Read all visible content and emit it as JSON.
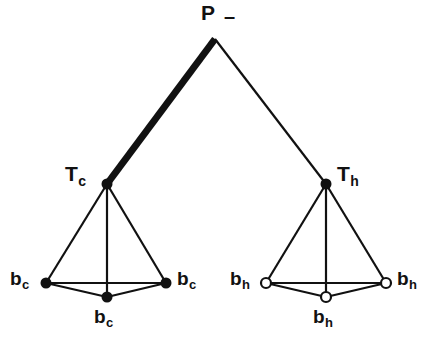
{
  "figure": {
    "background_color": "#ffffff",
    "ink_color": "#111111",
    "width": 431,
    "height": 347
  },
  "nodes": {
    "root": {
      "id": "P",
      "label_main": "P",
      "label_sub": "",
      "marker": "none",
      "x": 215,
      "y": 39,
      "annotation": "–",
      "annotation_name": "dash-mark"
    },
    "tc": {
      "id": "Tc",
      "label_main": "T",
      "label_sub": "c",
      "marker": "filled",
      "x": 107,
      "y": 184
    },
    "th": {
      "id": "Th",
      "label_main": "T",
      "label_sub": "h",
      "marker": "filled",
      "x": 326,
      "y": 184
    },
    "bc_left": {
      "id": "bc-left",
      "label_main": "b",
      "label_sub": "c",
      "marker": "filled",
      "x": 46,
      "y": 283
    },
    "bc_right": {
      "id": "bc-right",
      "label_main": "b",
      "label_sub": "c",
      "marker": "filled",
      "x": 166,
      "y": 283
    },
    "bc_center": {
      "id": "bc-center",
      "label_main": "b",
      "label_sub": "c",
      "marker": "filled",
      "x": 107,
      "y": 297
    },
    "bh_left": {
      "id": "bh-left",
      "label_main": "b",
      "label_sub": "h",
      "marker": "open",
      "x": 266,
      "y": 283
    },
    "bh_right": {
      "id": "bh-right",
      "label_main": "b",
      "label_sub": "h",
      "marker": "open",
      "x": 386,
      "y": 283
    },
    "bh_center": {
      "id": "bh-center",
      "label_main": "b",
      "label_sub": "h",
      "marker": "open",
      "x": 326,
      "y": 297
    }
  },
  "edges": [
    {
      "name": "edge-p-tc",
      "from": "root",
      "to": "tc",
      "weight": "thick"
    },
    {
      "name": "edge-p-th",
      "from": "root",
      "to": "th",
      "weight": "thin"
    },
    {
      "name": "edge-tc-bc-left",
      "from": "tc",
      "to": "bc_left",
      "weight": "thin"
    },
    {
      "name": "edge-tc-bc-center",
      "from": "tc",
      "to": "bc_center",
      "weight": "thin"
    },
    {
      "name": "edge-tc-bc-right",
      "from": "tc",
      "to": "bc_right",
      "weight": "thin"
    },
    {
      "name": "edge-bc-left-right",
      "from": "bc_left",
      "to": "bc_right",
      "weight": "thin"
    },
    {
      "name": "edge-bc-left-center",
      "from": "bc_left",
      "to": "bc_center",
      "weight": "thin"
    },
    {
      "name": "edge-bc-center-right",
      "from": "bc_center",
      "to": "bc_right",
      "weight": "thin"
    },
    {
      "name": "edge-th-bh-left",
      "from": "th",
      "to": "bh_left",
      "weight": "thin"
    },
    {
      "name": "edge-th-bh-center",
      "from": "th",
      "to": "bh_center",
      "weight": "thin"
    },
    {
      "name": "edge-th-bh-right",
      "from": "th",
      "to": "bh_right",
      "weight": "thin"
    },
    {
      "name": "edge-bh-left-right",
      "from": "bh_left",
      "to": "bh_right",
      "weight": "thin"
    },
    {
      "name": "edge-bh-left-center",
      "from": "bh_left",
      "to": "bh_center",
      "weight": "thin"
    },
    {
      "name": "edge-bh-center-right",
      "from": "bh_center",
      "to": "bh_right",
      "weight": "thin"
    }
  ],
  "style": {
    "thick_width": 7,
    "thin_width": 2.2,
    "filled_radius": 5.5,
    "open_radius": 5.0,
    "open_stroke": 2.2
  }
}
